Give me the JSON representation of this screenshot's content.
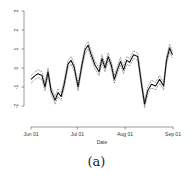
{
  "caption": "(a)",
  "chart_data": {
    "type": "line",
    "title": "",
    "xlabel": "Date",
    "ylabel": "",
    "x_ticks": [
      "Jun 01",
      "Jul 01",
      "Aug 01",
      "Sep 01"
    ],
    "y_ticks": [
      -2,
      -1,
      0,
      1,
      2,
      3
    ],
    "ylim": [
      -2,
      3
    ],
    "grid": false,
    "legend": null,
    "x_day_offsets_from_jun01": [
      0,
      2.6,
      4.5,
      7.1,
      9.1,
      11,
      13,
      15.6,
      17.5,
      19.5,
      21.4,
      24,
      26,
      27.9,
      30.5,
      33.1,
      35,
      37,
      39,
      41.5,
      44.1,
      46,
      48,
      50,
      52,
      54,
      56,
      58,
      60,
      62,
      63.9,
      66.5,
      69.1,
      71.7,
      73.6,
      75.6,
      78.1,
      80.7,
      83.3,
      85.9,
      87.8,
      89.8,
      91.7
    ],
    "series": [
      {
        "name": "estimate",
        "style": "solid",
        "values": [
          -0.6,
          -0.4,
          -0.3,
          -0.4,
          -1.0,
          -0.2,
          -1.2,
          -1.7,
          -1.3,
          -1.5,
          -0.9,
          0.2,
          0.4,
          0.05,
          -1.0,
          0.2,
          0.95,
          1.2,
          0.7,
          0.15,
          -0.2,
          0.5,
          0.0,
          0.6,
          0.15,
          -0.6,
          -0.1,
          0.35,
          -0.1,
          0.4,
          0.3,
          0.7,
          0.6,
          -0.9,
          -1.9,
          -1.2,
          -0.85,
          -0.95,
          -0.6,
          -0.95,
          0.4,
          1.05,
          0.7
        ]
      },
      {
        "name": "upper band",
        "style": "dashed",
        "values": [
          -0.4,
          -0.2,
          -0.1,
          -0.2,
          -0.8,
          0.0,
          -1.0,
          -1.5,
          -1.1,
          -1.3,
          -0.7,
          0.4,
          0.6,
          0.25,
          -0.8,
          0.4,
          1.15,
          1.4,
          0.9,
          0.35,
          0.0,
          0.7,
          0.2,
          0.8,
          0.35,
          -0.4,
          0.1,
          0.55,
          0.1,
          0.6,
          0.5,
          0.9,
          0.8,
          -0.7,
          -1.7,
          -1.0,
          -0.65,
          -0.75,
          -0.4,
          -0.75,
          0.6,
          1.25,
          0.9
        ]
      },
      {
        "name": "lower band",
        "style": "dashed",
        "values": [
          -0.8,
          -0.6,
          -0.5,
          -0.6,
          -1.2,
          -0.4,
          -1.4,
          -1.9,
          -1.5,
          -1.7,
          -1.1,
          0.0,
          0.2,
          -0.15,
          -1.2,
          0.0,
          0.75,
          1.0,
          0.5,
          -0.05,
          -0.4,
          0.3,
          -0.2,
          0.4,
          -0.05,
          -0.8,
          -0.3,
          0.15,
          -0.3,
          0.2,
          0.1,
          0.5,
          0.4,
          -1.1,
          -2.1,
          -1.4,
          -1.05,
          -1.15,
          -0.8,
          -1.15,
          0.2,
          0.85,
          0.5
        ]
      }
    ]
  }
}
